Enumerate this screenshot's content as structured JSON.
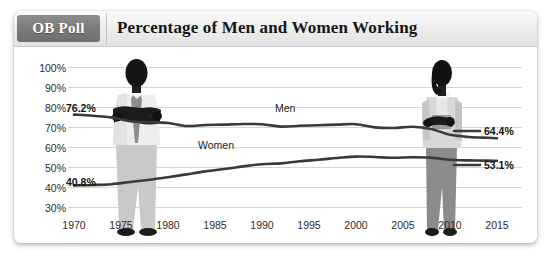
{
  "header": {
    "badge_label": "OB Poll",
    "title": "Percentage of Men and Women Working"
  },
  "chart_data": {
    "type": "line",
    "title": "Percentage of Men and Women Working",
    "xlabel": "",
    "ylabel": "",
    "xlim": [
      1970,
      2015
    ],
    "ylim": [
      30,
      100
    ],
    "grid": true,
    "legend": "inline",
    "x_ticks": [
      "1970",
      "1975",
      "1980",
      "1985",
      "1990",
      "1995",
      "2000",
      "2005",
      "2010",
      "2015"
    ],
    "y_ticks": [
      "30%",
      "40%",
      "50%",
      "60%",
      "70%",
      "80%",
      "90%",
      "100%"
    ],
    "annotations": {
      "men_start": "76.2%",
      "men_end": "64.4%",
      "women_start": "40.8%",
      "women_end": "53.1%"
    },
    "series": [
      {
        "name": "Men",
        "color": "#3a3a3a",
        "x": [
          1970,
          1972,
          1974,
          1976,
          1978,
          1980,
          1982,
          1984,
          1986,
          1988,
          1990,
          1992,
          1994,
          1996,
          1998,
          2000,
          2002,
          2004,
          2006,
          2008,
          2010,
          2012,
          2014,
          2015
        ],
        "values": [
          76.2,
          75.6,
          74.8,
          72.9,
          72.4,
          72.0,
          70.5,
          71.0,
          71.2,
          71.5,
          71.4,
          70.2,
          70.6,
          70.9,
          71.2,
          71.4,
          69.8,
          69.5,
          70.1,
          69.0,
          66.1,
          65.0,
          64.6,
          64.4
        ]
      },
      {
        "name": "Women",
        "color": "#3a3a3a",
        "x": [
          1970,
          1972,
          1974,
          1976,
          1978,
          1980,
          1982,
          1984,
          1986,
          1988,
          1990,
          1992,
          1994,
          1996,
          1998,
          2000,
          2002,
          2004,
          2006,
          2008,
          2010,
          2012,
          2014,
          2015
        ],
        "values": [
          40.8,
          41.0,
          41.4,
          42.5,
          43.6,
          44.9,
          46.3,
          47.8,
          49.0,
          50.3,
          51.4,
          51.8,
          52.9,
          53.6,
          54.5,
          55.2,
          55.0,
          54.6,
          54.9,
          54.7,
          53.6,
          53.3,
          53.2,
          53.1
        ]
      }
    ]
  },
  "figures": [
    {
      "name": "man-silhouette",
      "year": 1975,
      "description": "man with crossed arms"
    },
    {
      "name": "woman-silhouette",
      "year": 2005,
      "description": "woman holding folder"
    }
  ]
}
